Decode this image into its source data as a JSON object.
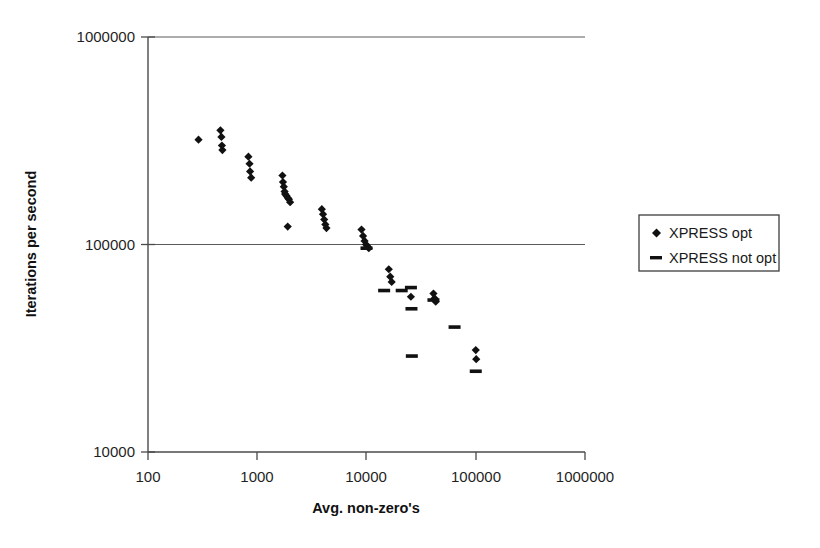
{
  "chart_data": {
    "type": "scatter",
    "title": "",
    "xlabel": "Avg. non-zero's",
    "ylabel": "Iterations per second",
    "xscale": "log",
    "yscale": "log",
    "xlim": [
      100,
      1000000
    ],
    "ylim": [
      10000,
      1000000
    ],
    "xticks": [
      100,
      1000,
      10000,
      100000,
      1000000
    ],
    "xtick_labels": [
      "100",
      "1000",
      "10000",
      "100000",
      "1000000"
    ],
    "yticks": [
      10000,
      100000,
      1000000
    ],
    "ytick_labels": [
      "10000",
      "100000",
      "1000000"
    ],
    "grid": "horizontal-major",
    "legend_position": "right-outside",
    "series": [
      {
        "name": "XPRESS opt",
        "marker": "diamond",
        "color": "#111111",
        "points": [
          [
            290,
            320000
          ],
          [
            460,
            355000
          ],
          [
            470,
            330000
          ],
          [
            475,
            300000
          ],
          [
            480,
            285000
          ],
          [
            830,
            265000
          ],
          [
            850,
            245000
          ],
          [
            860,
            225000
          ],
          [
            880,
            210000
          ],
          [
            1700,
            215000
          ],
          [
            1720,
            200000
          ],
          [
            1750,
            190000
          ],
          [
            1780,
            180000
          ],
          [
            1800,
            175000
          ],
          [
            1850,
            172000
          ],
          [
            1900,
            168000
          ],
          [
            1950,
            165000
          ],
          [
            2000,
            160000
          ],
          [
            1900,
            122000
          ],
          [
            3900,
            148000
          ],
          [
            4000,
            140000
          ],
          [
            4100,
            132000
          ],
          [
            4200,
            125000
          ],
          [
            4300,
            120000
          ],
          [
            9000,
            118000
          ],
          [
            9300,
            110000
          ],
          [
            9600,
            104000
          ],
          [
            9900,
            100000
          ],
          [
            10200,
            98000
          ],
          [
            10500,
            96000
          ],
          [
            16000,
            76000
          ],
          [
            16500,
            70000
          ],
          [
            17000,
            66000
          ],
          [
            25500,
            56000
          ],
          [
            41000,
            58000
          ],
          [
            42000,
            55000
          ],
          [
            43000,
            53000
          ],
          [
            100000,
            31000
          ],
          [
            101000,
            28000
          ]
        ]
      },
      {
        "name": "XPRESS not opt",
        "marker": "dash",
        "color": "#111111",
        "points": [
          [
            10000,
            96000
          ],
          [
            14500,
            60000
          ],
          [
            21000,
            60000
          ],
          [
            25500,
            62000
          ],
          [
            25800,
            49000
          ],
          [
            41000,
            54000
          ],
          [
            64000,
            40000
          ],
          [
            26000,
            29000
          ],
          [
            100000,
            24500
          ]
        ]
      }
    ]
  },
  "legend": {
    "items": [
      {
        "label": "XPRESS opt",
        "marker": "diamond"
      },
      {
        "label": "XPRESS not opt",
        "marker": "dash"
      }
    ]
  },
  "axes": {
    "x_title": "Avg. non-zero's",
    "y_title": "Iterations per second",
    "x_labels": [
      "100",
      "1000",
      "10000",
      "100000",
      "1000000"
    ],
    "y_labels": [
      "1000000",
      "100000",
      "10000"
    ]
  }
}
